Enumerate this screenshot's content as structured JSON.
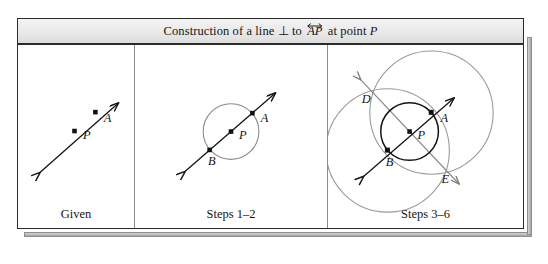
{
  "figure": {
    "title": {
      "prefix": "Construction of a line ",
      "perp_symbol": "⊥",
      "middle": " to ",
      "segment": "AP",
      "suffix": " at point ",
      "point": "P",
      "full_text": "Construction of a line ⊥ to AP at point P",
      "segment_decoration": "double-headed-overline-arrow"
    },
    "colors": {
      "frame_border": "#2b2b2b",
      "divider": "#8e8e8e",
      "title_background": "#e9e9e9",
      "shadow": "#bdbdbd",
      "construction_line": "#141414",
      "given_circle": "#8a8a8a",
      "arc": "#9a9a9a",
      "point_fill": "#111111",
      "canvas": "#ffffff"
    },
    "panels": [
      {
        "id": "given",
        "caption": "Given",
        "description": "A line through points P and A with arrowheads at both ends.",
        "points": [
          {
            "label": "P",
            "x": 74,
            "y": 131,
            "label_dx": 9,
            "label_dy": 8
          },
          {
            "label": "A",
            "x": 96,
            "y": 110,
            "label_dx": 9,
            "label_dy": 9
          }
        ],
        "line": {
          "x1": 35,
          "y1": 169,
          "x2": 122,
          "y2": 92,
          "arrows": "both"
        },
        "circles": []
      },
      {
        "id": "steps12",
        "caption": "Steps 1–2",
        "description": "Circle centered at P through A; line meets circle again at B.",
        "points": [
          {
            "label": "P",
            "x": 232,
            "y": 131,
            "label_dx": 9,
            "label_dy": 8
          },
          {
            "label": "A",
            "x": 254,
            "y": 112,
            "label_dx": 9,
            "label_dy": 9
          },
          {
            "label": "B",
            "x": 210,
            "y": 150,
            "label_dx": 1,
            "label_dy": 14
          }
        ],
        "line": {
          "x1": 186,
          "y1": 171,
          "x2": 277,
          "y2": 92,
          "arrows": "both"
        },
        "circles": [
          {
            "cx": 232,
            "cy": 131,
            "r": 28,
            "style": "gray"
          }
        ]
      },
      {
        "id": "steps36",
        "caption": "Steps 3–6",
        "description": "Arcs centered at A and B intersect at D and E; line DE is perpendicular to AP at P.",
        "points": [
          {
            "label": "P",
            "x": 427,
            "y": 131,
            "label_dx": 9,
            "label_dy": 8
          },
          {
            "label": "A",
            "x": 449,
            "y": 112,
            "label_dx": 9,
            "label_dy": 9
          },
          {
            "label": "B",
            "x": 405,
            "y": 150,
            "label_dx": 1,
            "label_dy": 14
          },
          {
            "label": "D",
            "x": 392,
            "y": 96,
            "label_dx": -12,
            "label_dy": 8
          },
          {
            "label": "E",
            "x": 462,
            "y": 167,
            "label_dx": 1,
            "label_dy": 14
          }
        ],
        "line": {
          "x1": 381,
          "y1": 176,
          "x2": 472,
          "y2": 97,
          "arrows": "both"
        },
        "perp_line": {
          "x1": 378,
          "y1": 79,
          "x2": 477,
          "y2": 184,
          "arrows": "both"
        },
        "circles": [
          {
            "cx": 427,
            "cy": 131,
            "r": 29,
            "style": "dark"
          },
          {
            "cx": 449,
            "cy": 112,
            "r": 62,
            "style": "gray"
          },
          {
            "cx": 405,
            "cy": 150,
            "r": 62,
            "style": "gray"
          }
        ]
      }
    ]
  }
}
